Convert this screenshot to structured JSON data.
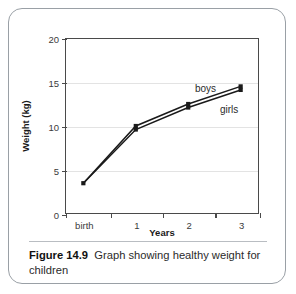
{
  "figure": {
    "caption_label": "Figure 14.9",
    "caption_text": "Graph showing healthy weight for children"
  },
  "chart_data": {
    "type": "line",
    "title": "",
    "xlabel": "Years",
    "ylabel": "Weight (kg)",
    "categories": [
      "birth",
      "1",
      "2",
      "3"
    ],
    "x": [
      0,
      1,
      2,
      3
    ],
    "xlim": [
      -0.35,
      3.35
    ],
    "ylim": [
      0,
      20
    ],
    "yticks": [
      0,
      5,
      10,
      15,
      20
    ],
    "ytick_labels": [
      "0",
      "5",
      "10",
      "15",
      "20"
    ],
    "grid": "horizontal",
    "legend": "inline-annotations",
    "marker": "square",
    "line_color": "#1a1a1a",
    "grid_color": "#e3e3e3",
    "axis_color": "#4a4a4a",
    "series": [
      {
        "name": "boys",
        "label": "boys",
        "values": [
          3.5,
          10.0,
          12.5,
          14.5
        ]
      },
      {
        "name": "girls",
        "label": "girls",
        "values": [
          3.5,
          9.6,
          12.1,
          14.1
        ]
      }
    ]
  }
}
